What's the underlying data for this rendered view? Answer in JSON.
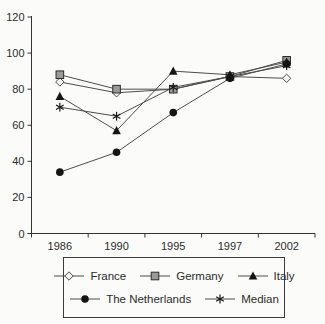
{
  "chart_data": {
    "type": "line",
    "categories": [
      "1986",
      "1990",
      "1995",
      "1997",
      "2002"
    ],
    "series": [
      {
        "name": "France",
        "marker": "diamond-open",
        "values": [
          84,
          78,
          80,
          87,
          86
        ]
      },
      {
        "name": "Germany",
        "marker": "square-gray",
        "values": [
          88,
          80,
          80,
          87,
          96
        ]
      },
      {
        "name": "Italy",
        "marker": "triangle-filled",
        "values": [
          76,
          57,
          90,
          88,
          95
        ]
      },
      {
        "name": "The Netherlands",
        "marker": "circle-filled",
        "values": [
          34,
          45,
          67,
          86,
          94
        ]
      },
      {
        "name": "Median",
        "marker": "asterisk",
        "values": [
          70,
          65,
          81,
          87,
          93
        ]
      }
    ],
    "title": "",
    "xlabel": "",
    "ylabel": "",
    "ylim": [
      0,
      120
    ],
    "yticks": [
      0,
      20,
      40,
      60,
      80,
      100,
      120
    ],
    "grid": false,
    "legend_position": "bottom-box",
    "colors": {
      "line": "#4d4d4d",
      "axis": "#333333",
      "marker_dark": "#151515",
      "square_fill": "#9a9a9a",
      "diamond_fill": "#f2f2ef",
      "text": "#2b2b2b"
    }
  }
}
